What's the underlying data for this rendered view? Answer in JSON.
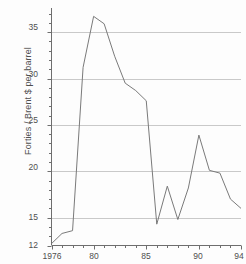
{
  "chart_data": {
    "type": "line",
    "title": "",
    "xlabel": "",
    "ylabel": "Forties / Brent $ per barrel",
    "xlim": [
      1976,
      1994
    ],
    "ylim": [
      12,
      37.6
    ],
    "grid": "horizontal",
    "legend": "none",
    "x": [
      1976,
      1977,
      1978,
      1979,
      1980,
      1981,
      1982,
      1983,
      1984,
      1985,
      1986,
      1987,
      1988,
      1989,
      1990,
      1991,
      1992,
      1993,
      1994
    ],
    "values": [
      12.2,
      13.3,
      13.6,
      31.2,
      36.7,
      35.9,
      32.4,
      29.5,
      28.7,
      27.6,
      14.3,
      18.4,
      14.8,
      18.2,
      23.9,
      20.1,
      19.8,
      17.0,
      16.0
    ],
    "series": [
      {
        "name": "Forties / Brent $ per barrel",
        "values": [
          12.2,
          13.3,
          13.6,
          31.2,
          36.7,
          35.9,
          32.4,
          29.5,
          28.7,
          27.6,
          14.3,
          18.4,
          14.8,
          18.2,
          23.9,
          20.1,
          19.8,
          17.0,
          16.0
        ]
      }
    ],
    "yticks": [
      12,
      15,
      20,
      25,
      30,
      35
    ],
    "ytick_labels": [
      "12",
      "15",
      "20",
      "25",
      "30",
      "35"
    ],
    "xticks": [
      1976,
      1980,
      1985,
      1990,
      1994
    ],
    "xtick_labels": [
      "1976",
      "80",
      "85",
      "90",
      "94"
    ],
    "xminor_ticks": [
      1977,
      1978,
      1979,
      1981,
      1982,
      1983,
      1984,
      1986,
      1987,
      1988,
      1989,
      1991,
      1992,
      1993
    ],
    "colors": {
      "line": "#7a7a7a",
      "grid": "#c9c9c9",
      "axis": "#6e6e6e",
      "text": "#4f4f4f",
      "background": "#fdfdfd"
    }
  }
}
